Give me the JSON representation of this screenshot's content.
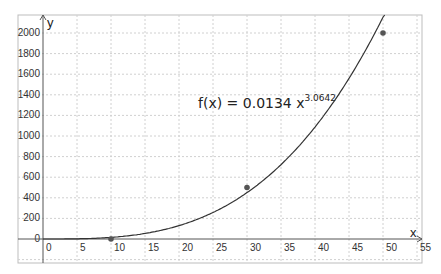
{
  "chart_data": {
    "type": "scatter",
    "title": "",
    "xlabel": "x",
    "ylabel": "y",
    "xlim": [
      -3.5,
      55.5
    ],
    "ylim": [
      -230,
      2180
    ],
    "grid": true,
    "x_ticks": [
      0,
      5,
      10,
      15,
      20,
      25,
      30,
      35,
      40,
      45,
      50,
      55
    ],
    "y_ticks": [
      0,
      200,
      400,
      600,
      800,
      1000,
      1200,
      1400,
      1600,
      1800,
      2000
    ],
    "series": [
      {
        "name": "data points",
        "type": "scatter",
        "x": [
          10,
          30,
          50
        ],
        "y": [
          0,
          500,
          2000
        ],
        "color": "#555555"
      },
      {
        "name": "f(x) = 0.0134 x^3.0642",
        "type": "line",
        "function": {
          "form": "power",
          "a": 0.0134,
          "b": 3.0642
        },
        "color": "#333333"
      }
    ],
    "annotations": [
      {
        "text": "f(x) = 0.0134 x",
        "superscript": "3.0642",
        "x": 26,
        "y": 1100
      }
    ]
  },
  "labels": {
    "x_axis": "x",
    "y_axis": "y",
    "equation_main": "f(x) = 0.0134 x",
    "equation_exp": "3.0642"
  }
}
